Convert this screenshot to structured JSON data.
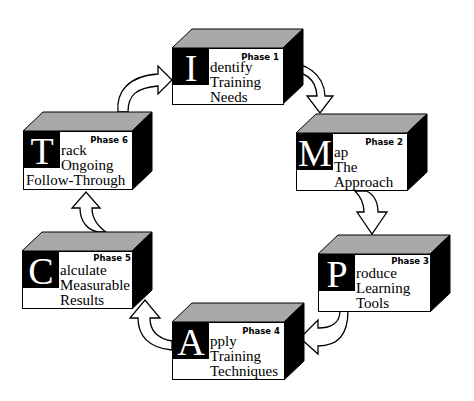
{
  "diagram": {
    "type": "cycle",
    "colors": {
      "box_face": "#ffffff",
      "top_face": "#a8a8a8",
      "side_face": "#000000",
      "letter_bg": "#000000",
      "letter_fg": "#ffffff",
      "arrow_fill": "#ffffff",
      "arrow_stroke": "#000000"
    },
    "phases": [
      {
        "letter": "I",
        "phase": "Phase 1",
        "line1": "dentify",
        "line2": "Training",
        "line3": "Needs"
      },
      {
        "letter": "M",
        "phase": "Phase 2",
        "line1": "ap",
        "line2": "The",
        "line3": "Approach"
      },
      {
        "letter": "P",
        "phase": "Phase 3",
        "line1": "roduce",
        "line2": "Learning",
        "line3": "Tools"
      },
      {
        "letter": "A",
        "phase": "Phase 4",
        "line1": "pply",
        "line2": "Training",
        "line3": "Techniques"
      },
      {
        "letter": "C",
        "phase": "Phase 5",
        "line1": "alculate",
        "line2": "Measurable",
        "line3": "Results"
      },
      {
        "letter": "T",
        "phase": "Phase 6",
        "line1": "rack",
        "line2": "Ongoing",
        "line3": "Follow-Through"
      }
    ],
    "flow": [
      "Phase 1",
      "Phase 2",
      "Phase 3",
      "Phase 4",
      "Phase 5",
      "Phase 6",
      "Phase 1"
    ]
  }
}
